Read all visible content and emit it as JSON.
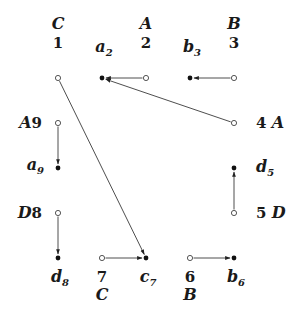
{
  "diagram": {
    "colors": {
      "line": "#3a3a3a",
      "node_fill": "#111111",
      "text": "#1a1a1a"
    },
    "nodes": [
      {
        "id": "1",
        "type": "open",
        "number": "1",
        "letter": "C",
        "label_pos": "above"
      },
      {
        "id": "a2",
        "type": "filled",
        "base": "a",
        "sub": "2",
        "label_pos": "above"
      },
      {
        "id": "2",
        "type": "open",
        "number": "2",
        "letter": "A",
        "label_pos": "above"
      },
      {
        "id": "b3",
        "type": "filled",
        "base": "b",
        "sub": "3",
        "label_pos": "above"
      },
      {
        "id": "3",
        "type": "open",
        "number": "3",
        "letter": "B",
        "label_pos": "above"
      },
      {
        "id": "4",
        "type": "open",
        "number": "4",
        "letter": "A",
        "label_pos": "right"
      },
      {
        "id": "d5",
        "type": "filled",
        "base": "d",
        "sub": "5",
        "label_pos": "right"
      },
      {
        "id": "5",
        "type": "open",
        "number": "5",
        "letter": "D",
        "label_pos": "right"
      },
      {
        "id": "9",
        "type": "open",
        "number": "9",
        "letter": "A",
        "label_pos": "left"
      },
      {
        "id": "a9",
        "type": "filled",
        "base": "a",
        "sub": "9",
        "label_pos": "left"
      },
      {
        "id": "8",
        "type": "open",
        "number": "8",
        "letter": "D",
        "label_pos": "left"
      },
      {
        "id": "d8",
        "type": "filled",
        "base": "d",
        "sub": "8",
        "label_pos": "below"
      },
      {
        "id": "7",
        "type": "open",
        "number": "7",
        "letter": "C",
        "label_pos": "below"
      },
      {
        "id": "c7",
        "type": "filled",
        "base": "c",
        "sub": "7",
        "label_pos": "below"
      },
      {
        "id": "6",
        "type": "open",
        "number": "6",
        "letter": "B",
        "label_pos": "below"
      },
      {
        "id": "b6",
        "type": "filled",
        "base": "b",
        "sub": "6",
        "label_pos": "below"
      }
    ],
    "edges": [
      {
        "from": "2",
        "to": "a2"
      },
      {
        "from": "3",
        "to": "b3"
      },
      {
        "from": "4",
        "to": "a2"
      },
      {
        "from": "1",
        "to": "c7"
      },
      {
        "from": "9",
        "to": "a9"
      },
      {
        "from": "8",
        "to": "d8"
      },
      {
        "from": "5",
        "to": "d5"
      },
      {
        "from": "7",
        "to": "c7"
      },
      {
        "from": "6",
        "to": "b6"
      }
    ]
  }
}
